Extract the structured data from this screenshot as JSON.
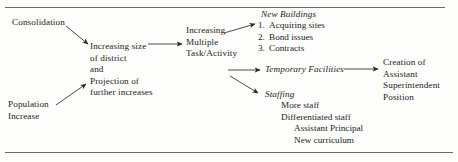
{
  "diagram": {
    "type": "flowchart",
    "title": "",
    "nodes": {
      "consolidation": {
        "lines": [
          "Consolidation"
        ]
      },
      "population_increase": {
        "lines": [
          "Population",
          "Increase"
        ]
      },
      "increasing_size": {
        "lines": [
          "Increasing size",
          "of district",
          "and",
          "Projection of",
          "further increases"
        ]
      },
      "multiple_task": {
        "lines": [
          "Increasing",
          "Multiple",
          "Task/Activity"
        ]
      },
      "new_buildings": {
        "heading": "New Buildings",
        "items": [
          {
            "num": "1.",
            "label": "Acquiring sites"
          },
          {
            "num": "2.",
            "label": "Bond issues"
          },
          {
            "num": "3.",
            "label": "Contracts"
          }
        ]
      },
      "temporary_facilities": {
        "heading": "Temporary Facilities"
      },
      "staffing": {
        "heading": "Staffing",
        "items": [
          {
            "label": "More staff"
          },
          {
            "label": "Differentiated staff"
          },
          {
            "label": "Assistant Principal"
          },
          {
            "label": "New curriculum"
          }
        ]
      },
      "creation_position": {
        "lines": [
          "Creation of",
          "Assistant",
          "Superintendent",
          "Position"
        ]
      }
    },
    "edges": [
      {
        "from": "consolidation",
        "to": "increasing_size",
        "style": "arrow"
      },
      {
        "from": "population_increase",
        "to": "increasing_size",
        "style": "arrow"
      },
      {
        "from": "increasing_size",
        "to": "multiple_task",
        "style": "arrow"
      },
      {
        "from": "multiple_task",
        "to": "new_buildings",
        "style": "arrow"
      },
      {
        "from": "multiple_task",
        "to": "temporary_facilities",
        "style": "arrow"
      },
      {
        "from": "multiple_task",
        "to": "staffing",
        "style": "arrow"
      },
      {
        "from": "temporary_facilities",
        "to": "creation_position",
        "style": "arrow"
      }
    ],
    "colors": {
      "ink": "#1c1c1c",
      "rule": "#6b6b6b",
      "background": "#fdfdfc"
    }
  }
}
